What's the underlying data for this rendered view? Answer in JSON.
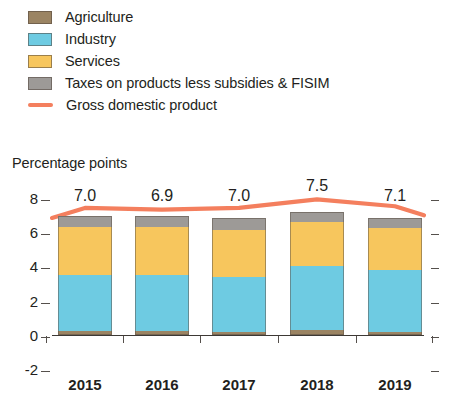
{
  "legend": {
    "items": [
      {
        "label": "Agriculture",
        "type": "swatch",
        "color": "#9b8463",
        "icon": "square-swatch-icon"
      },
      {
        "label": "Industry",
        "type": "swatch",
        "color": "#6ecbe2",
        "icon": "square-swatch-icon"
      },
      {
        "label": "Services",
        "type": "swatch",
        "color": "#f7c65d",
        "icon": "square-swatch-icon"
      },
      {
        "label": "Taxes on products less subsidies & FISIM",
        "type": "swatch",
        "color": "#9d9a97",
        "icon": "square-swatch-icon"
      },
      {
        "label": "Gross domestic product",
        "type": "line",
        "color": "#f47f5e",
        "icon": "line-swatch-icon"
      }
    ]
  },
  "chart_data": {
    "type": "bar",
    "subtype": "stacked-bar-with-line-overlay",
    "title": "",
    "ylabel": "Percentage points",
    "xlabel": "",
    "categories": [
      "2015",
      "2016",
      "2017",
      "2018",
      "2019"
    ],
    "ylim": [
      -2,
      8
    ],
    "yticks": [
      -2,
      0,
      2,
      4,
      6,
      8
    ],
    "ytick_labels": [
      "-2",
      "0",
      "2",
      "4",
      "6",
      "8"
    ],
    "grid": false,
    "legend_position": "top-left",
    "series": [
      {
        "name": "Agriculture",
        "color": "#9b8463",
        "values": [
          0.25,
          0.25,
          0.2,
          0.3,
          0.2
        ]
      },
      {
        "name": "Industry",
        "color": "#6ecbe2",
        "values": [
          3.25,
          3.25,
          3.2,
          3.75,
          3.6
        ]
      },
      {
        "name": "Services",
        "color": "#f7c65d",
        "values": [
          2.8,
          2.8,
          2.75,
          2.55,
          2.45
        ]
      },
      {
        "name": "Taxes on products less subsidies & FISIM",
        "color": "#9d9a97",
        "values": [
          0.65,
          0.65,
          0.65,
          0.6,
          0.6
        ]
      }
    ],
    "line_series": {
      "name": "Gross domestic product",
      "color": "#f47f5e",
      "values": [
        7.0,
        6.9,
        7.0,
        7.5,
        7.1
      ]
    },
    "data_labels": [
      "7.0",
      "6.9",
      "7.0",
      "7.5",
      "7.1"
    ]
  }
}
